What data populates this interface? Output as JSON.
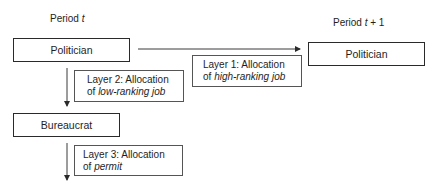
{
  "period_left": {
    "prefix": "Period ",
    "var": "t"
  },
  "period_right": {
    "prefix": "Period ",
    "var": "t",
    "suffix": " + 1"
  },
  "nodes": {
    "politician_t": "Politician",
    "politician_t1": "Politician",
    "bureaucrat": "Bureaucrat"
  },
  "layers": [
    {
      "line1": "Layer 1: Allocation",
      "line2_prefix": "of ",
      "line2_em": "high-ranking job"
    },
    {
      "line1": "Layer 2: Allocation",
      "line2_prefix": "of ",
      "line2_em": "low-ranking job"
    },
    {
      "line1": "Layer 3: Allocation",
      "line2_prefix": "of ",
      "line2_em": "permit"
    }
  ]
}
